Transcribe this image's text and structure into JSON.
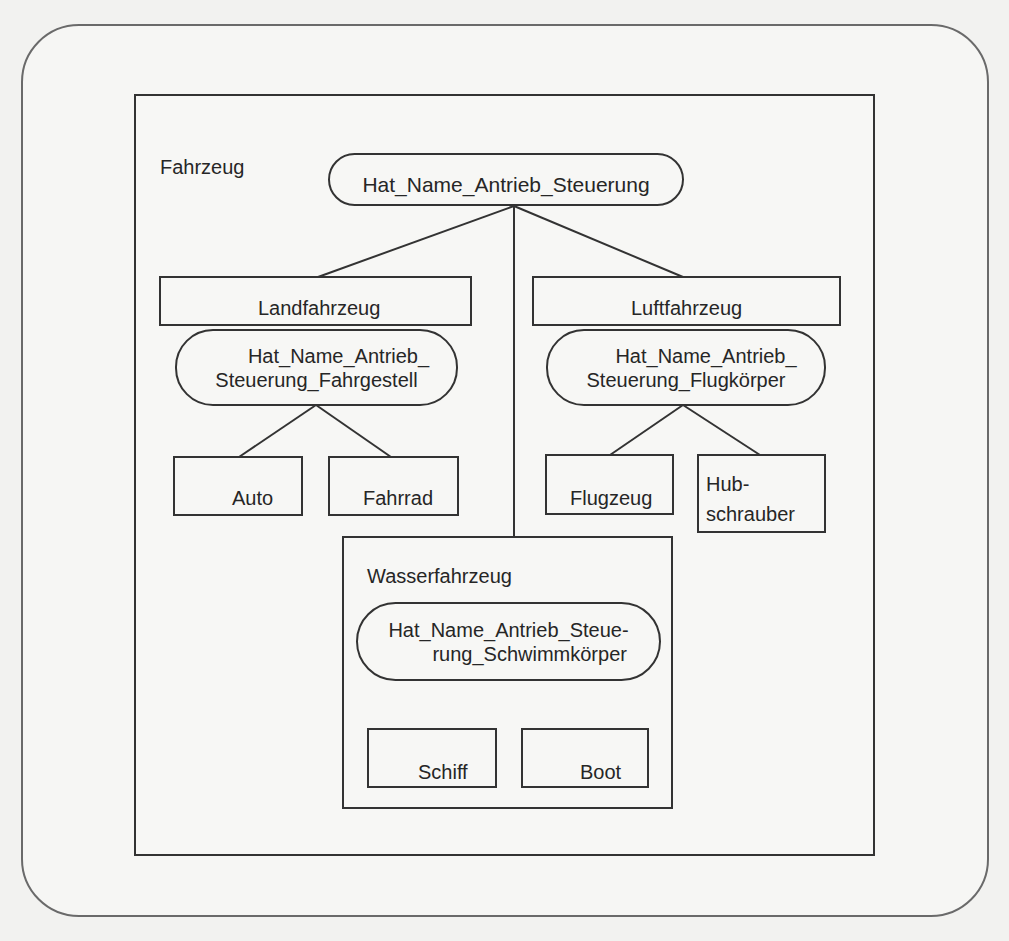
{
  "diagram": {
    "type": "class-hierarchy",
    "root": {
      "label": "Fahrzeug",
      "attributes": "Hat_Name_Antrieb_Steuerung"
    },
    "branches": [
      {
        "label": "Landfahrzeug",
        "attributes_line1": "Hat_Name_Antrieb_",
        "attributes_line2": "Steuerung_Fahrgestell",
        "children": [
          "Auto",
          "Fahrrad"
        ]
      },
      {
        "label": "Luftfahrzeug",
        "attributes_line1": "Hat_Name_Antrieb_",
        "attributes_line2": "Steuerung_Flugkörper",
        "children": [
          "Flugzeug",
          "Hub-",
          "schrauber"
        ]
      },
      {
        "label": "Wasserfahrzeug",
        "attributes_line1": "Hat_Name_Antrieb_Steue-",
        "attributes_line2": "rung_Schwimmkörper",
        "children": [
          "Schiff",
          "Boot"
        ]
      }
    ]
  },
  "colors": {
    "line": "#333333",
    "text": "#262626",
    "paper": "#f2f2f0",
    "outer_frame": "#6a6a6a"
  }
}
